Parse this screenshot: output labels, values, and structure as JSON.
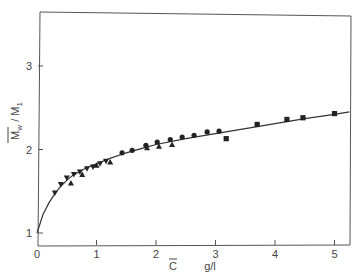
{
  "chart_data": {
    "type": "scatter",
    "title": "",
    "xlabel": "C̄   g/l",
    "ylabel": "M̄w / M1",
    "xlabel_parts": {
      "symbol": "C",
      "unit": "g/l"
    },
    "ylabel_parts": {
      "num": "M",
      "num_sub": "w",
      "sep": "/",
      "den": "M",
      "den_sub": "1"
    },
    "xlim": [
      0,
      5.25
    ],
    "ylim": [
      0.85,
      3.65
    ],
    "x_ticks": [
      0,
      1,
      2,
      3,
      4,
      5
    ],
    "x_tick_labels": [
      "0",
      "1",
      "2",
      "3",
      "4",
      "5"
    ],
    "y_ticks": [
      1,
      2,
      3
    ],
    "y_tick_labels": [
      "1",
      "2",
      "3"
    ],
    "grid": false,
    "legend": null,
    "series": [
      {
        "name": "down-triangles",
        "marker": "triangle-down",
        "points": [
          [
            0.3,
            1.48
          ],
          [
            0.4,
            1.58
          ],
          [
            0.5,
            1.66
          ],
          [
            0.62,
            1.7
          ],
          [
            0.72,
            1.73
          ],
          [
            0.84,
            1.77
          ],
          [
            0.94,
            1.79
          ],
          [
            1.06,
            1.83
          ],
          [
            1.16,
            1.86
          ]
        ]
      },
      {
        "name": "up-triangles",
        "marker": "triangle-up",
        "points": [
          [
            0.57,
            1.6
          ],
          [
            0.76,
            1.7
          ],
          [
            1.0,
            1.81
          ],
          [
            1.23,
            1.85
          ],
          [
            1.85,
            2.02
          ],
          [
            2.05,
            2.04
          ],
          [
            2.27,
            2.06
          ]
        ]
      },
      {
        "name": "circles",
        "marker": "circle",
        "points": [
          [
            1.43,
            1.96
          ],
          [
            1.6,
            1.99
          ],
          [
            1.83,
            2.05
          ],
          [
            2.02,
            2.09
          ],
          [
            2.24,
            2.12
          ],
          [
            2.44,
            2.15
          ],
          [
            2.64,
            2.17
          ],
          [
            2.86,
            2.21
          ],
          [
            3.06,
            2.22
          ]
        ]
      },
      {
        "name": "squares",
        "marker": "square",
        "points": [
          [
            3.18,
            2.13
          ],
          [
            3.7,
            2.3
          ],
          [
            4.2,
            2.36
          ],
          [
            4.47,
            2.38
          ],
          [
            5.0,
            2.43
          ]
        ]
      }
    ],
    "curve": {
      "name": "fit",
      "points": [
        [
          0,
          1.0
        ],
        [
          0.1,
          1.22
        ],
        [
          0.2,
          1.36
        ],
        [
          0.3,
          1.47
        ],
        [
          0.4,
          1.56
        ],
        [
          0.5,
          1.63
        ],
        [
          0.6,
          1.69
        ],
        [
          0.8,
          1.77
        ],
        [
          1.0,
          1.83
        ],
        [
          1.25,
          1.9
        ],
        [
          1.5,
          1.96
        ],
        [
          1.75,
          2.01
        ],
        [
          2.0,
          2.06
        ],
        [
          2.5,
          2.13
        ],
        [
          3.0,
          2.19
        ],
        [
          3.5,
          2.25
        ],
        [
          4.0,
          2.31
        ],
        [
          4.5,
          2.37
        ],
        [
          5.0,
          2.42
        ],
        [
          5.25,
          2.45
        ]
      ]
    }
  }
}
